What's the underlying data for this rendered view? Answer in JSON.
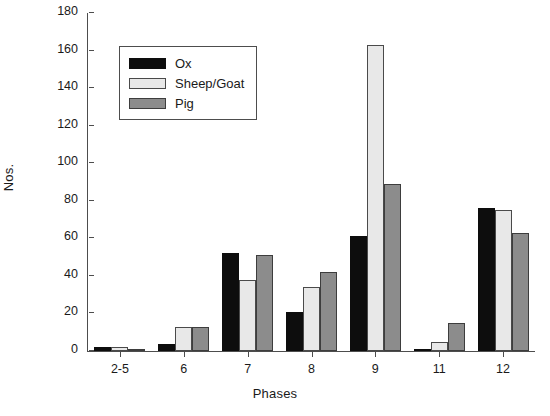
{
  "chart_data": {
    "type": "bar",
    "title": "",
    "xlabel": "Phases",
    "ylabel": "Nos.",
    "categories": [
      "2-5",
      "6",
      "7",
      "8",
      "9",
      "11",
      "12"
    ],
    "series": [
      {
        "name": "Ox",
        "color": "#0d0d0d",
        "values": [
          2,
          4,
          52,
          21,
          61,
          1,
          76
        ]
      },
      {
        "name": "Sheep/Goat",
        "color": "#e8e8e8",
        "values": [
          2,
          13,
          38,
          34,
          163,
          5,
          75
        ]
      },
      {
        "name": "Pig",
        "color": "#8c8c8c",
        "values": [
          1,
          13,
          51,
          42,
          89,
          15,
          63
        ]
      }
    ],
    "ylim": [
      0,
      180
    ],
    "yticks": [
      0,
      20,
      40,
      60,
      80,
      100,
      120,
      140,
      160,
      180
    ],
    "grid": false,
    "legend_position": "upper-left-inside"
  }
}
